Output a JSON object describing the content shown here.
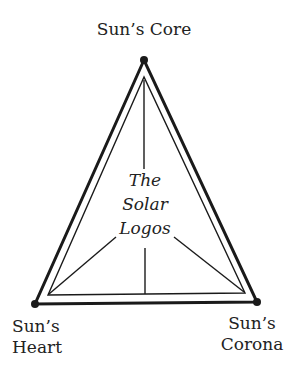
{
  "diagram": {
    "type": "triangle",
    "vertices": [
      {
        "id": "top",
        "label": "Sun’s Core"
      },
      {
        "id": "bottom-left",
        "label_line1": "Sun’s",
        "label_line2": "Heart"
      },
      {
        "id": "bottom-right",
        "label_line1": "Sun’s",
        "label_line2": "Corona"
      }
    ],
    "center": {
      "line1": "The",
      "line2": "Solar",
      "line3": "Logos"
    },
    "colors": {
      "line": "#1a1a1a",
      "background": "#ffffff"
    }
  }
}
